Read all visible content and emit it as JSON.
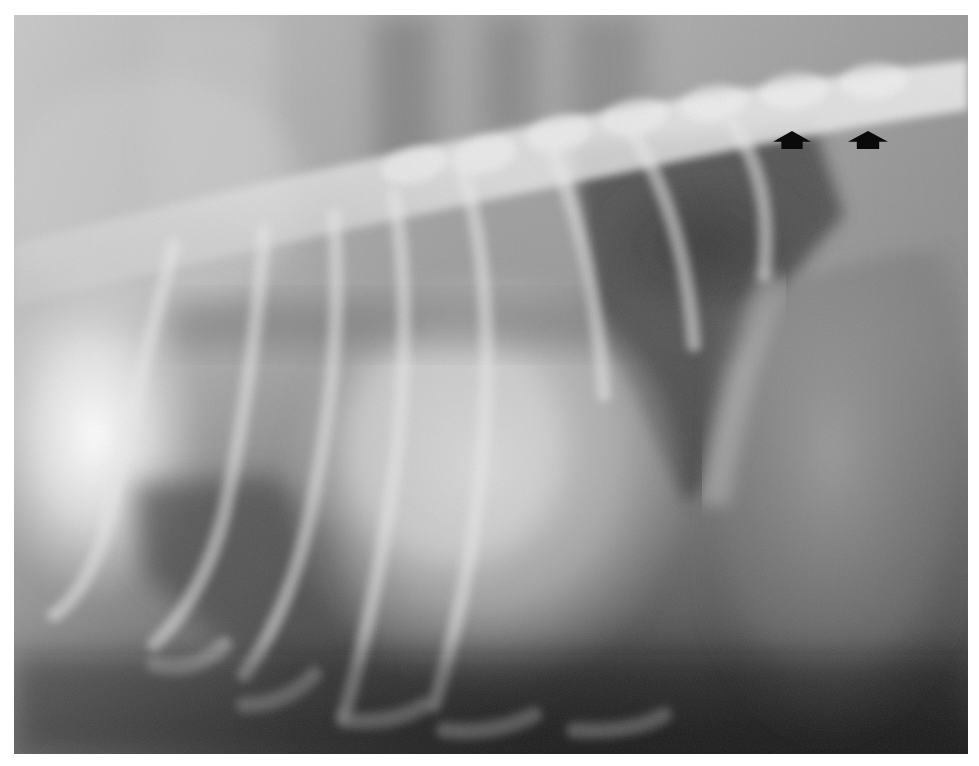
{
  "figure": {
    "type": "radiograph",
    "modality": "X-ray",
    "view": "lateral thorax",
    "tone": "grayscale",
    "frame": {
      "x": 14,
      "y": 15,
      "width": 954,
      "height": 739
    },
    "background_color": "#ffffff"
  },
  "annotations": {
    "arrows": [
      {
        "id": "arrow-1",
        "direction": "up",
        "color": "#0a0a0a",
        "tip": [
          792,
          131
        ],
        "width": 38,
        "height": 18
      },
      {
        "id": "arrow-2",
        "direction": "up",
        "color": "#0a0a0a",
        "tip": [
          868,
          131
        ],
        "width": 40,
        "height": 18
      }
    ]
  }
}
